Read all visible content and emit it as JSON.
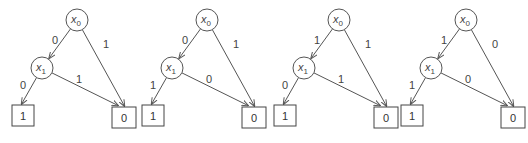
{
  "diagrams": [
    {
      "root": {
        "var": "x",
        "sub": "0"
      },
      "child": {
        "var": "x",
        "sub": "1"
      },
      "root_to_child_label": "0",
      "root_to_leaf0_label": "1",
      "child_to_leaf1_label": "0",
      "child_to_leaf0_label": "1",
      "leaf_left": "1",
      "leaf_right": "0"
    },
    {
      "root": {
        "var": "x",
        "sub": "0"
      },
      "child": {
        "var": "x",
        "sub": "1"
      },
      "root_to_child_label": "0",
      "root_to_leaf0_label": "1",
      "child_to_leaf1_label": "1",
      "child_to_leaf0_label": "0",
      "leaf_left": "1",
      "leaf_right": "0"
    },
    {
      "root": {
        "var": "x",
        "sub": "0"
      },
      "child": {
        "var": "x",
        "sub": "1"
      },
      "root_to_child_label": "1",
      "root_to_leaf0_label": "1",
      "child_to_leaf1_label": "0",
      "child_to_leaf0_label": "1",
      "leaf_left": "1",
      "leaf_right": "0"
    },
    {
      "root": {
        "var": "x",
        "sub": "0"
      },
      "child": {
        "var": "x",
        "sub": "1"
      },
      "root_to_child_label": "1",
      "root_to_leaf0_label": "0",
      "child_to_leaf1_label": "1",
      "child_to_leaf0_label": "0",
      "leaf_left": "1",
      "leaf_right": "0"
    }
  ]
}
